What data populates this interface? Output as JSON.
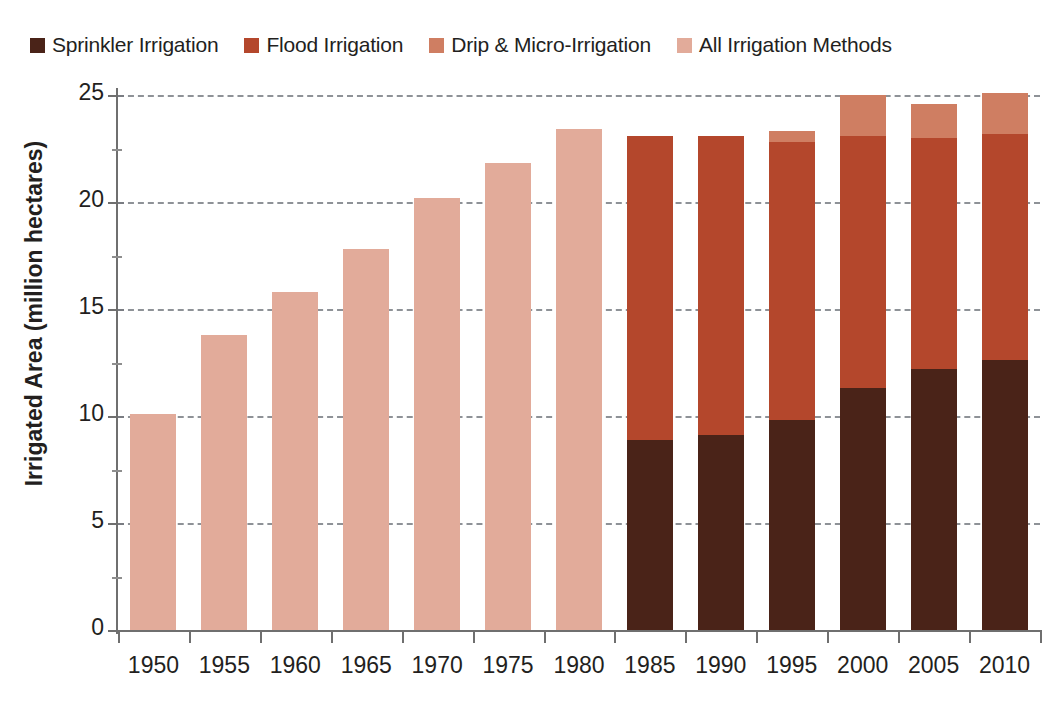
{
  "chart_data": {
    "type": "bar",
    "subtype": "stacked",
    "title": "",
    "xlabel": "",
    "ylabel": "Irrigated Area (million hectares)",
    "ylim": [
      0,
      25
    ],
    "yticks": [
      0,
      5,
      10,
      15,
      20,
      25
    ],
    "ytick_labels": [
      "0",
      "5",
      "10",
      "15",
      "20",
      "25"
    ],
    "grid": true,
    "grid_axis": "y",
    "grid_style": "dashed",
    "legend_position": "top",
    "categories": [
      "1950",
      "1955",
      "1960",
      "1965",
      "1970",
      "1975",
      "1980",
      "1985",
      "1990",
      "1995",
      "2000",
      "2005",
      "2010"
    ],
    "series": [
      {
        "name": "Sprinkler Irrigation",
        "color": "#4a2318",
        "values": [
          0,
          0,
          0,
          0,
          0,
          0,
          0,
          8.9,
          9.1,
          9.8,
          11.3,
          12.2,
          12.6
        ]
      },
      {
        "name": "Flood Irrigation",
        "color": "#b4472c",
        "values": [
          0,
          0,
          0,
          0,
          0,
          0,
          0,
          14.2,
          14.0,
          13.0,
          11.8,
          10.8,
          10.6
        ]
      },
      {
        "name": "Drip & Micro-Irrigation",
        "color": "#cf7e62",
        "values": [
          0,
          0,
          0,
          0,
          0,
          0,
          0,
          0,
          0,
          0.5,
          1.9,
          1.6,
          1.9
        ]
      },
      {
        "name": "All Irrigation Methods",
        "color": "#e2ab9a",
        "values": [
          10.1,
          13.8,
          15.8,
          17.8,
          20.2,
          21.8,
          23.4,
          0,
          0,
          0,
          0,
          0,
          0
        ]
      }
    ],
    "totals": [
      10.1,
      13.8,
      15.8,
      17.8,
      20.2,
      21.8,
      23.4,
      23.1,
      23.1,
      23.3,
      25.0,
      24.6,
      25.1
    ]
  },
  "legend": {
    "items": [
      {
        "label": "Sprinkler Irrigation",
        "color": "#4a2318"
      },
      {
        "label": "Flood Irrigation",
        "color": "#b4472c"
      },
      {
        "label": "Drip & Micro-Irrigation",
        "color": "#cf7e62"
      },
      {
        "label": "All Irrigation Methods",
        "color": "#e2ab9a"
      }
    ]
  }
}
